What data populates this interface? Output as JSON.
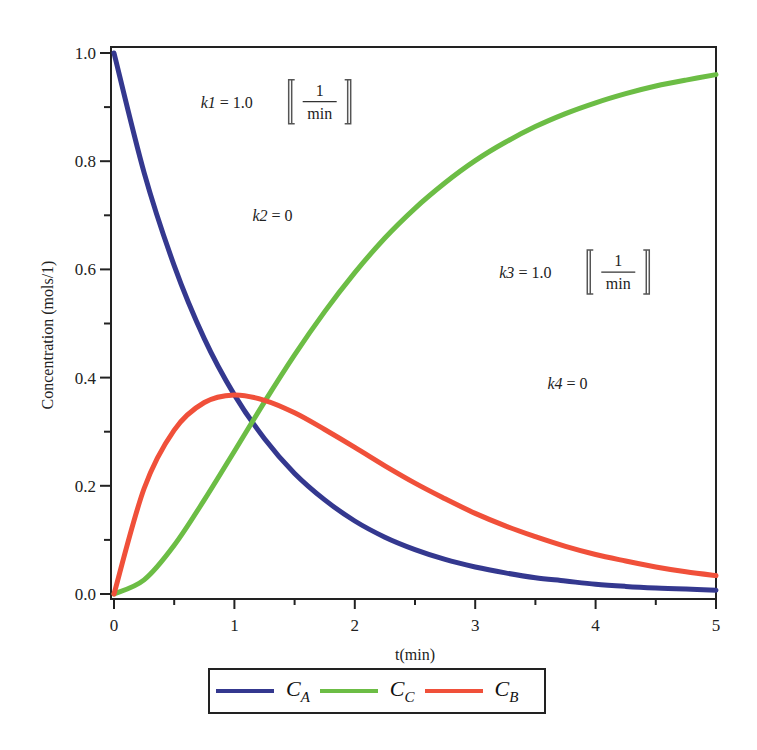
{
  "chart_data": {
    "type": "line",
    "title": "",
    "xlabel": "t(min)",
    "ylabel": "Concentration (mols/1)",
    "xlim": [
      0,
      5
    ],
    "ylim": [
      0,
      1.0
    ],
    "x_ticks": [
      "0",
      "1",
      "2",
      "3",
      "4",
      "5"
    ],
    "y_ticks": [
      "0.0",
      "0.2",
      "0.4",
      "0.6",
      "0.8",
      "1.0"
    ],
    "grid": false,
    "legend_position": "bottom",
    "x": [
      0,
      0.25,
      0.5,
      0.75,
      1,
      1.25,
      1.5,
      1.75,
      2,
      2.25,
      2.5,
      2.75,
      3,
      3.25,
      3.5,
      3.75,
      4,
      4.25,
      4.5,
      4.75,
      5
    ],
    "series": [
      {
        "name": "C_A",
        "label_main": "C",
        "label_sub": "A",
        "color": "#34388f",
        "values": [
          1.0,
          0.779,
          0.607,
          0.472,
          0.368,
          0.287,
          0.223,
          0.174,
          0.135,
          0.105,
          0.082,
          0.064,
          0.05,
          0.039,
          0.03,
          0.024,
          0.018,
          0.014,
          0.011,
          0.009,
          0.007
        ]
      },
      {
        "name": "C_C",
        "label_main": "C",
        "label_sub": "C",
        "color": "#6cbd45",
        "values": [
          0.0,
          0.026,
          0.09,
          0.174,
          0.264,
          0.355,
          0.442,
          0.522,
          0.594,
          0.658,
          0.713,
          0.76,
          0.801,
          0.835,
          0.864,
          0.888,
          0.908,
          0.925,
          0.939,
          0.95,
          0.96
        ]
      },
      {
        "name": "C_B",
        "label_main": "C",
        "label_sub": "B",
        "color": "#f0503a",
        "values": [
          0.0,
          0.195,
          0.303,
          0.354,
          0.368,
          0.358,
          0.335,
          0.304,
          0.271,
          0.237,
          0.205,
          0.176,
          0.149,
          0.126,
          0.106,
          0.088,
          0.073,
          0.061,
          0.05,
          0.041,
          0.034
        ]
      }
    ],
    "annotations": [
      {
        "id": "k1",
        "var": "k1",
        "eq": " = 1.0",
        "unit_num": "1",
        "unit_den": "min",
        "x": 0.72,
        "y": 0.91
      },
      {
        "id": "k2",
        "var": "k2",
        "eq": " = 0",
        "unit_num": null,
        "unit_den": null,
        "x": 1.15,
        "y": 0.7
      },
      {
        "id": "k3",
        "var": "k3",
        "eq": " = 1.0",
        "unit_num": "1",
        "unit_den": "min",
        "x": 3.2,
        "y": 0.595
      },
      {
        "id": "k4",
        "var": "k4",
        "eq": " = 0",
        "unit_num": null,
        "unit_den": null,
        "x": 3.6,
        "y": 0.39
      }
    ]
  }
}
